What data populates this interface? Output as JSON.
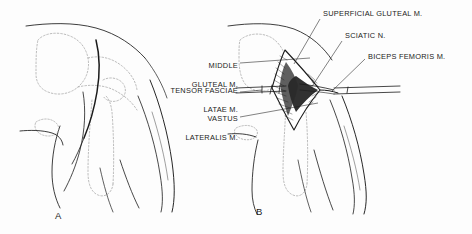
{
  "figure": {
    "type": "anatomical-illustration",
    "background_color": "#fdfdfd",
    "ink_color": "#1b1b1b",
    "dotted_color": "#9a9a9a"
  },
  "panels": [
    {
      "id": "A",
      "letter": "A",
      "x": 55,
      "y": 216
    },
    {
      "id": "B",
      "letter": "B",
      "x": 256,
      "y": 212
    }
  ],
  "labels_left": [
    {
      "id": "middle-gluteal",
      "lines": [
        "MIDDLE",
        "GLUTEAL M."
      ],
      "text": "MIDDLE GLUTEAL M.",
      "anchor_x": 238,
      "anchor_y": 64,
      "text_right_x": 238,
      "text_top_y": 53,
      "leader_to_x": 310,
      "leader_to_y": 58
    },
    {
      "id": "tensor-fasciae-latae",
      "lines": [
        "TENSOR FASCIAE",
        "LATAE M."
      ],
      "text": "TENSOR FASCIAE LATAE M.",
      "anchor_x": 238,
      "anchor_y": 93,
      "text_right_x": 238,
      "text_top_y": 78,
      "leader_to_x": 320,
      "leader_to_y": 88
    },
    {
      "id": "vastus-lateralis",
      "lines": [
        "VASTUS",
        "LATERALIS M."
      ],
      "text": "VASTUS LATERALIS M.",
      "anchor_x": 238,
      "anchor_y": 118,
      "text_right_x": 238,
      "text_top_y": 106,
      "leader_to_x": 316,
      "leader_to_y": 104
    }
  ],
  "labels_right": [
    {
      "id": "superficial-gluteal",
      "text": "SUPERFICIAL GLUTEAL M.",
      "text_left_x": 323,
      "text_top_y": 10,
      "leader_from_x": 320,
      "leader_from_y": 19,
      "leader_to_x": 295,
      "leader_to_y": 63
    },
    {
      "id": "sciatic-nerve",
      "text": "SCIATIC N.",
      "text_left_x": 345,
      "text_top_y": 32,
      "leader_from_x": 342,
      "leader_from_y": 41,
      "leader_to_x": 312,
      "leader_to_y": 88
    },
    {
      "id": "biceps-femoris",
      "text": "BICEPS FEMORIS M.",
      "text_left_x": 368,
      "text_top_y": 53,
      "leader_from_x": 364,
      "leader_from_y": 60,
      "leader_to_x": 330,
      "leader_to_y": 92
    }
  ]
}
